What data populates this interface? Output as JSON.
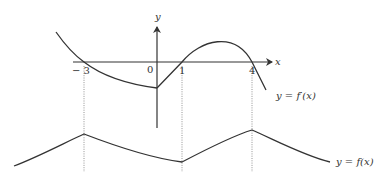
{
  "diagram": {
    "axes": {
      "x_label": "x",
      "y_label": "y",
      "origin_label": "0"
    },
    "ticks": [
      {
        "value": -3,
        "label": "− 3"
      },
      {
        "value": 1,
        "label": "1"
      },
      {
        "value": 4,
        "label": "4"
      }
    ],
    "curves": {
      "derivative": {
        "label": "y = f′(x)",
        "zeros": [
          -3,
          1,
          4
        ],
        "corner_at": 0
      },
      "function": {
        "label": "y = f(x)",
        "local_max": [
          -3,
          4
        ],
        "local_min": [
          1
        ]
      }
    },
    "colors": {
      "ink": "#333333",
      "guide": "#888888",
      "background": "#ffffff"
    }
  }
}
